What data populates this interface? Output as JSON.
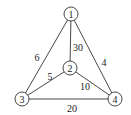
{
  "diagram": {
    "type": "weighted-undirected-graph",
    "nodes": [
      {
        "id": "1",
        "label": "1",
        "x": 71,
        "y": 14
      },
      {
        "id": "2",
        "label": "2",
        "x": 70,
        "y": 68
      },
      {
        "id": "3",
        "label": "3",
        "x": 22,
        "y": 99
      },
      {
        "id": "4",
        "label": "4",
        "x": 115,
        "y": 99
      }
    ],
    "edges": [
      {
        "from": "1",
        "to": "3",
        "weight": "6",
        "label_x": 37,
        "label_y": 57
      },
      {
        "from": "1",
        "to": "2",
        "weight": "30",
        "label_x": 78,
        "label_y": 47
      },
      {
        "from": "1",
        "to": "4",
        "weight": "4",
        "label_x": 104,
        "label_y": 62
      },
      {
        "from": "2",
        "to": "3",
        "weight": "5",
        "label_x": 50,
        "label_y": 76
      },
      {
        "from": "2",
        "to": "4",
        "weight": "10",
        "label_x": 85,
        "label_y": 86
      },
      {
        "from": "3",
        "to": "4",
        "weight": "20",
        "label_x": 72,
        "label_y": 108
      }
    ],
    "node_radius": 7,
    "colors": {
      "stroke": "#333333",
      "text": "#222222",
      "background": "#ffffff"
    }
  }
}
